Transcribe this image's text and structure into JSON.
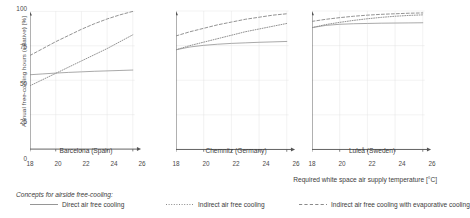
{
  "chart_data": {
    "type": "line",
    "title": "",
    "xlabel": "Required white space air supply temperature [°C]",
    "ylabel": "Annual free-cooling hours (relative) [%]",
    "xlim": [
      18,
      26
    ],
    "ylim": [
      0,
      100
    ],
    "xticks": [
      18,
      20,
      22,
      24,
      26
    ],
    "yticks": [
      0,
      25,
      50,
      75,
      100
    ],
    "grid": true,
    "legend_position": "bottom",
    "legend_title": "Concepts for airside free-cooling:",
    "series_styles": [
      "solid",
      "dotted",
      "dashed"
    ],
    "series_color": "#8a8a8a",
    "panels": [
      {
        "name": "Barcelona (Spain)",
        "x": [
          18,
          19,
          20,
          21,
          22,
          23,
          24,
          25,
          26
        ],
        "series": [
          {
            "name": "Direct air free cooling",
            "style": "solid",
            "values": [
              54.0,
              54.6,
              55.2,
              55.7,
              56.1,
              56.5,
              56.8,
              57.1,
              57.4
            ]
          },
          {
            "name": "Indirect air free cooling",
            "style": "dotted",
            "values": [
              46.0,
              50.5,
              55.0,
              59.5,
              64.0,
              68.5,
              73.0,
              78.0,
              83.0
            ]
          },
          {
            "name": "Indirect air free cooling with evaporative cooling",
            "style": "dashed",
            "values": [
              68.0,
              73.0,
              78.0,
              82.5,
              87.0,
              91.0,
              94.5,
              97.5,
              100.0
            ]
          }
        ]
      },
      {
        "name": "Chemnitz (Germany)",
        "x": [
          18,
          19,
          20,
          21,
          22,
          23,
          24,
          25,
          26
        ],
        "series": [
          {
            "name": "Direct air free cooling",
            "style": "solid",
            "values": [
              72.0,
              74.0,
              75.2,
              76.0,
              76.6,
              77.0,
              77.4,
              77.7,
              78.0
            ]
          },
          {
            "name": "Indirect air free cooling",
            "style": "dotted",
            "values": [
              72.0,
              75.0,
              77.5,
              80.0,
              82.5,
              85.0,
              87.0,
              89.0,
              91.0
            ]
          },
          {
            "name": "Indirect air free cooling with evaporative cooling",
            "style": "dashed",
            "values": [
              82.0,
              85.0,
              87.5,
              90.0,
              92.0,
              94.0,
              95.5,
              97.0,
              98.0
            ]
          }
        ]
      },
      {
        "name": "Luleå (Sweden)",
        "x": [
          18,
          19,
          20,
          21,
          22,
          23,
          24,
          25,
          26
        ],
        "series": [
          {
            "name": "Direct air free cooling",
            "style": "solid",
            "values": [
              88.0,
              89.6,
              90.4,
              90.8,
              91.0,
              91.2,
              91.3,
              91.4,
              91.5
            ]
          },
          {
            "name": "Indirect air free cooling",
            "style": "dotted",
            "values": [
              88.0,
              90.2,
              91.8,
              93.2,
              94.4,
              95.4,
              96.2,
              96.8,
              97.2
            ]
          },
          {
            "name": "Indirect air free cooling with evaporative cooling",
            "style": "dashed",
            "values": [
              92.5,
              94.0,
              95.2,
              96.2,
              97.0,
              97.6,
              98.0,
              98.4,
              98.6
            ]
          }
        ]
      }
    ]
  },
  "axes": {
    "ylabel": "Annual free-cooling hours (relative) [%]",
    "xlabel": "Required white space air supply temperature [°C]"
  },
  "legend": {
    "title": "Concepts for airside free-cooling:",
    "items": [
      {
        "label": "Direct air free cooling",
        "style": "solid"
      },
      {
        "label": "Indirect air free cooling",
        "style": "dotted"
      },
      {
        "label": "Indirect air free cooling with evaporative cooling",
        "style": "dashed"
      }
    ]
  }
}
